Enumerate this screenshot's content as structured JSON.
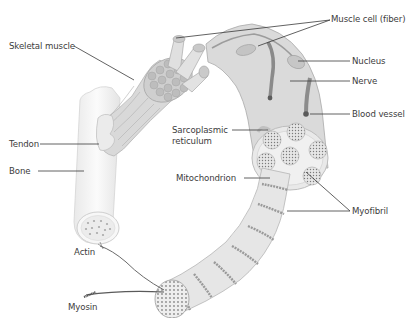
{
  "diagram": {
    "colors": {
      "muscle_fill": "#d2d2d2",
      "muscle_stroke": "#a8a8a8",
      "dark_detail": "#6e6e6e",
      "bone_fill": "#f3f3f3",
      "leader_line": "#3a3a3a",
      "label_text": "#3c3c3c",
      "background": "#ffffff"
    },
    "labels": {
      "muscle_cell": "Muscle cell (fiber)",
      "skeletal_muscle": "Skeletal muscle",
      "nucleus": "Nucleus",
      "nerve": "Nerve",
      "blood_vessel": "Blood vessel",
      "tendon": "Tendon",
      "sarcoplasmic_line1": "Sarcoplasmic",
      "sarcoplasmic_line2": "reticulum",
      "bone": "Bone",
      "mitochondrion": "Mitochondrion",
      "myofibril": "Myofibril",
      "actin": "Actin",
      "myosin": "Myosin"
    }
  }
}
